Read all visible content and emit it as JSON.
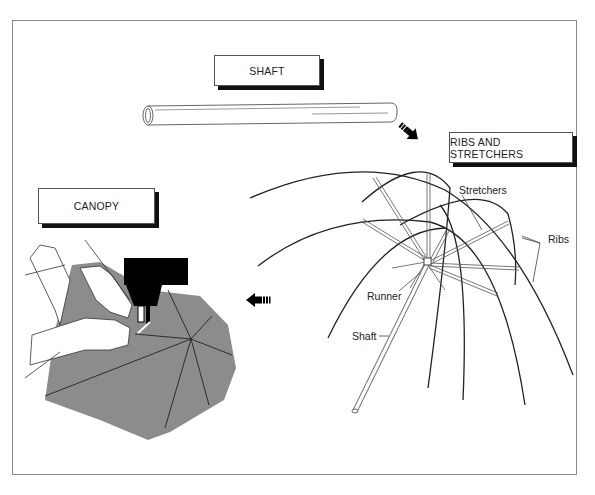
{
  "diagram": {
    "title_boxes": {
      "shaft": "SHAFT",
      "ribs_and_stretchers": "RIBS AND STRETCHERS",
      "canopy": "CANOPY"
    },
    "callouts": {
      "stretchers": "Stretchers",
      "ribs": "Ribs",
      "runner": "Runner",
      "shaft": "Shaft"
    },
    "flow": [
      {
        "from": "shaft",
        "to": "ribs_and_stretchers",
        "arrow": "arrow-down-right"
      },
      {
        "from": "ribs_and_stretchers",
        "to": "canopy",
        "arrow": "arrow-left"
      }
    ],
    "colors": {
      "line": "#222222",
      "canopy_fabric": "#8c8c8c",
      "machine": "#000000",
      "frame": "#888888"
    }
  }
}
